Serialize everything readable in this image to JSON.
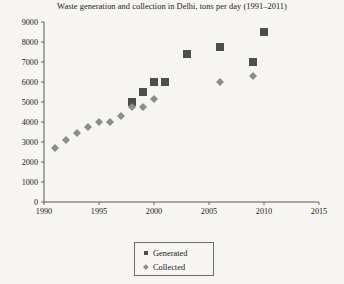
{
  "chart_data": {
    "type": "scatter",
    "title": "Waste generation and collection in Delhi, tons per day (1991–2011)",
    "xlabel": "",
    "ylabel": "",
    "xlim": [
      1990,
      2015
    ],
    "ylim": [
      0,
      9000
    ],
    "xticks": [
      1990,
      1995,
      2000,
      2005,
      2010,
      2015
    ],
    "yticks": [
      0,
      1000,
      2000,
      3000,
      4000,
      5000,
      6000,
      7000,
      8000,
      9000
    ],
    "xtick_labels": [
      "1990",
      "1995",
      "2000",
      "2005",
      "2010",
      "2015"
    ],
    "ytick_labels": [
      "0",
      "1000",
      "2000",
      "3000",
      "4000",
      "5000",
      "6000",
      "7000",
      "8000",
      "9000"
    ],
    "grid": false,
    "legend_position": "bottom-center",
    "series": [
      {
        "name": "Generated",
        "marker": "square",
        "color": "#4d4d4d",
        "points": [
          {
            "x": 1998,
            "y": 5000
          },
          {
            "x": 1999,
            "y": 5500
          },
          {
            "x": 2000,
            "y": 6000
          },
          {
            "x": 2001,
            "y": 6000
          },
          {
            "x": 2003,
            "y": 7400
          },
          {
            "x": 2006,
            "y": 7750
          },
          {
            "x": 2009,
            "y": 7000
          },
          {
            "x": 2010,
            "y": 8500
          }
        ]
      },
      {
        "name": "Collected",
        "marker": "diamond",
        "color": "#8c8c8c",
        "points": [
          {
            "x": 1991,
            "y": 2700
          },
          {
            "x": 1992,
            "y": 3100
          },
          {
            "x": 1993,
            "y": 3450
          },
          {
            "x": 1994,
            "y": 3750
          },
          {
            "x": 1995,
            "y": 4000
          },
          {
            "x": 1996,
            "y": 4000
          },
          {
            "x": 1997,
            "y": 4300
          },
          {
            "x": 1998,
            "y": 4750
          },
          {
            "x": 1999,
            "y": 4750
          },
          {
            "x": 2000,
            "y": 5150
          },
          {
            "x": 2006,
            "y": 6000
          },
          {
            "x": 2009,
            "y": 6300
          }
        ]
      }
    ]
  },
  "legend": {
    "entries": [
      {
        "label": "Generated",
        "marker": "square-marker-icon"
      },
      {
        "label": "Collected",
        "marker": "diamond-marker-icon"
      }
    ]
  }
}
